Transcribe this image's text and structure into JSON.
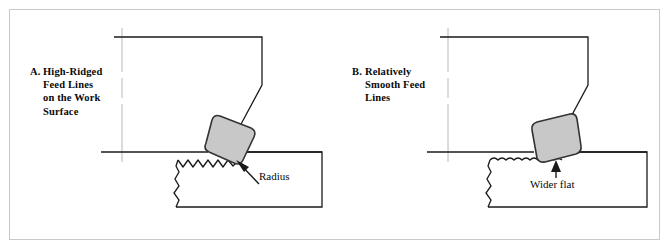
{
  "figure": {
    "frame_color": "#c9c9c9",
    "line_color": "#1a1a1a",
    "centerline_color": "#b8b8b8",
    "insert_fill": "#c8c8c8",
    "insert_stroke": "#333333",
    "background": "#ffffff"
  },
  "panels": [
    {
      "id": "panel-a",
      "caption": {
        "letter": "A.",
        "lines": [
          "High-Ridged",
          "Feed Lines",
          "on the Work",
          "Surface"
        ]
      },
      "annotation": {
        "label": "Radius",
        "arrow": "diagonal-up-left"
      },
      "insert_shape": "rounded-square-small-nose-radius",
      "surface_finish": "high-ridged"
    },
    {
      "id": "panel-b",
      "caption": {
        "letter": "B.",
        "lines": [
          "Relatively",
          "Smooth Feed",
          "Lines"
        ]
      },
      "annotation": {
        "label": "Wider flat",
        "arrow": "vertical-up"
      },
      "insert_shape": "flat-bottom-large-nose-radius",
      "surface_finish": "relatively-smooth"
    }
  ]
}
